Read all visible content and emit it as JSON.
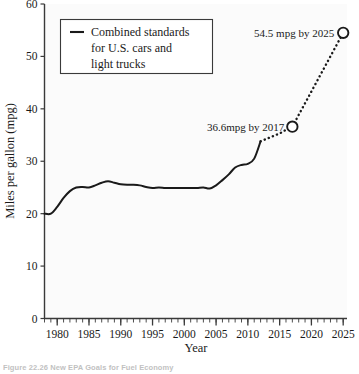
{
  "figure": {
    "caption": "Figure 22.26  New EPA Goals for Fuel Economy",
    "background_color": "#ffffff",
    "plot_background_color": "#fbfbfb",
    "line_color": "#1a1a1a",
    "axis_color": "#3a3a3a"
  },
  "axes": {
    "y_title": "Miles per gallon (mpg)",
    "x_title": "Year",
    "y_ticks": [
      "0",
      "10",
      "20",
      "30",
      "40",
      "50",
      "60"
    ],
    "x_ticks": [
      "1980",
      "1985",
      "1990",
      "1995",
      "2000",
      "2005",
      "2010",
      "2015",
      "2020",
      "2025"
    ]
  },
  "legend": {
    "lines": [
      "Combined standards",
      "for U.S. cars and",
      "light trucks"
    ],
    "swatch": "line-swatch"
  },
  "annotations": [
    {
      "label": "36.6mpg by 2017",
      "x": 2017,
      "y": 36.6,
      "marker": "open-circle"
    },
    {
      "label": "54.5 mpg by 2025",
      "x": 2025,
      "y": 54.5,
      "marker": "open-circle"
    }
  ],
  "chart_data": {
    "type": "line",
    "title": "New EPA Goals for Fuel Economy",
    "xlabel": "Year",
    "ylabel": "Miles per gallon (mpg)",
    "xlim": [
      1978,
      2025.6
    ],
    "ylim": [
      0,
      60
    ],
    "grid": false,
    "legend_position": "upper-left",
    "x_major_ticks": [
      1980,
      1985,
      1990,
      1995,
      2000,
      2005,
      2010,
      2015,
      2020,
      2025
    ],
    "x_minor_tick_step": 1,
    "y_major_ticks": [
      0,
      10,
      20,
      30,
      40,
      50,
      60
    ],
    "series": [
      {
        "name": "Combined standards for U.S. cars and light trucks",
        "style": "solid",
        "x": [
          1978,
          1979,
          1980,
          1981,
          1982,
          1983,
          1984,
          1985,
          1986,
          1987,
          1988,
          1989,
          1990,
          1991,
          1992,
          1993,
          1994,
          1995,
          1996,
          1997,
          1998,
          1999,
          2000,
          2001,
          2002,
          2003,
          2004,
          2005,
          2006,
          2007,
          2008,
          2009,
          2010,
          2011,
          2012
        ],
        "y": [
          20.0,
          20.0,
          21.3,
          23.0,
          24.3,
          25.0,
          25.1,
          25.0,
          25.4,
          25.9,
          26.2,
          25.9,
          25.6,
          25.5,
          25.5,
          25.4,
          25.1,
          24.9,
          25.0,
          24.9,
          24.9,
          24.9,
          24.9,
          24.9,
          24.9,
          25.0,
          24.8,
          25.4,
          26.4,
          27.5,
          28.8,
          29.3,
          29.5,
          30.5,
          33.8
        ]
      },
      {
        "name": "Projection to 2017 standard",
        "style": "dotted",
        "x": [
          2012,
          2013,
          2014,
          2015,
          2016,
          2017
        ],
        "y": [
          33.8,
          34.3,
          34.8,
          35.3,
          36.0,
          36.6
        ]
      },
      {
        "name": "Projection to 2025 standard",
        "style": "dotted",
        "x": [
          2017,
          2025
        ],
        "y": [
          36.6,
          54.5
        ]
      }
    ],
    "markers": [
      {
        "x": 2017,
        "y": 36.6,
        "type": "open-circle"
      },
      {
        "x": 2025,
        "y": 54.5,
        "type": "open-circle"
      }
    ]
  }
}
